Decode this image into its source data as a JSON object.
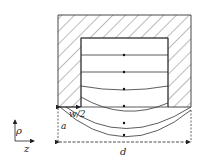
{
  "diagram": {
    "labels": {
      "half_width": "w/2",
      "radius": "a",
      "depth": "d",
      "axis_rho": "ρ",
      "axis_z": "z"
    },
    "colors": {
      "line": "#333333",
      "hatch": "#555555",
      "background": "#ffffff"
    },
    "field_line_count": 6
  }
}
